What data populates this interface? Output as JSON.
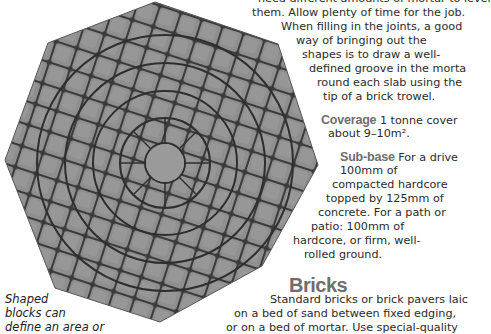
{
  "figure": {
    "caption_lines": [
      "Shaped",
      "blocks can",
      "define an area or"
    ]
  },
  "body_text": {
    "intro_lines": [
      "need different amounts of mortar to level",
      "them. Allow plenty of time for the job.",
      "When filling in the joints, a good",
      "way of bringing out the",
      "shapes is to draw a well-",
      "defined groove in the morta",
      "round each slab using the",
      "tip of a brick trowel."
    ],
    "coverage": {
      "label": "Coverage",
      "lines": [
        " 1 tonne cover",
        "about 9–10m²."
      ]
    },
    "subbase": {
      "label": "Sub-base",
      "lines": [
        " For a drive",
        "100mm of",
        "compacted hardcore",
        "topped by 125mm of",
        "concrete. For a path or",
        "patio: 100mm of",
        "hardcore, or firm, well-",
        "rolled ground."
      ]
    }
  },
  "bricks_section": {
    "heading": "Bricks",
    "lines": [
      "Standard bricks or brick pavers laic",
      "on a bed of sand between fixed edging,",
      "or on a bed of mortar. Use special-quality"
    ]
  }
}
